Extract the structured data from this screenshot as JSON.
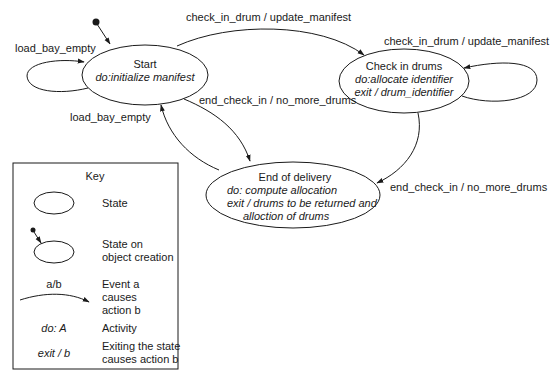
{
  "diagram": {
    "type": "state-machine",
    "initial_state": "Start",
    "states": [
      {
        "id": "start",
        "name": "Start",
        "lines": [
          "do:initialize manifest"
        ]
      },
      {
        "id": "check_in",
        "name": "Check in drums",
        "lines": [
          "do:allocate identifier",
          "exit / drum_identifier"
        ]
      },
      {
        "id": "end",
        "name": "End of delivery",
        "lines": [
          "do: compute allocation",
          "exit / drums to be returned and",
          "alloction of drums"
        ]
      }
    ],
    "transitions": [
      {
        "from": "start",
        "to": "start",
        "label": "load_bay_empty"
      },
      {
        "from": "start",
        "to": "check_in",
        "label": "check_in_drum / update_manifest"
      },
      {
        "from": "check_in",
        "to": "check_in",
        "label": "check_in_drum / update_manifest"
      },
      {
        "from": "start",
        "to": "end",
        "label": "end_check_in / no_more_drums"
      },
      {
        "from": "end",
        "to": "start",
        "label": "load_bay_empty"
      },
      {
        "from": "check_in",
        "to": "end",
        "label": "end_check_in / no_more_drums"
      }
    ]
  },
  "key": {
    "title": "Key",
    "items": [
      {
        "symbol": "",
        "description": [
          "State"
        ]
      },
      {
        "symbol": "",
        "description": [
          "State on",
          "object creation"
        ]
      },
      {
        "symbol": "a/b",
        "description": [
          "Event a",
          "causes",
          "action b"
        ]
      },
      {
        "symbol": "do: A",
        "description": [
          "Activity"
        ]
      },
      {
        "symbol": "exit / b",
        "description": [
          "Exiting the state",
          "causes action b"
        ]
      }
    ]
  }
}
